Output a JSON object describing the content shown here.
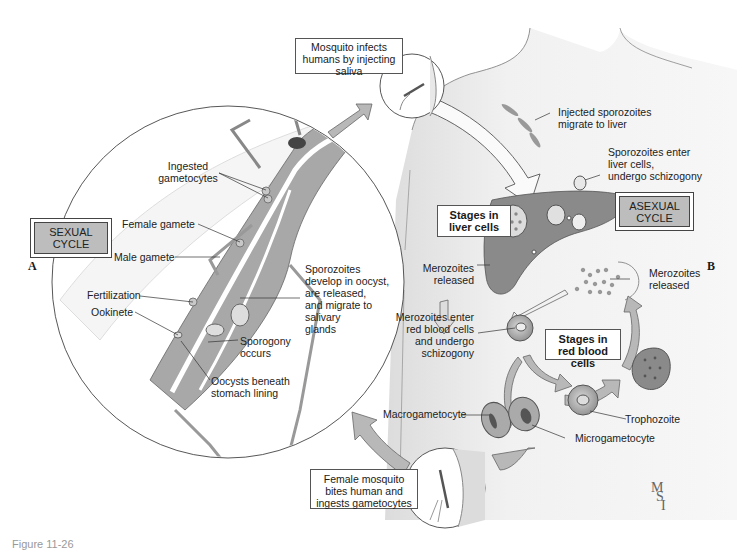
{
  "figure": {
    "caption": "Figure 11-26",
    "signature": [
      "M",
      "S",
      "I"
    ],
    "colors": {
      "cycle_box_fill": "#bdbdbd",
      "arrow_fill": "#b8b8b8",
      "tissue_gray": "#9a9a9a",
      "body_fill": "#ececec",
      "liver_fill": "#8a8a8a"
    }
  },
  "panels": {
    "A": {
      "letter": "A",
      "cycle_box": [
        "SEXUAL",
        "CYCLE"
      ],
      "labels": {
        "ingested_gametocytes": [
          "Ingested",
          "gametocytes"
        ],
        "female_gamete": "Female gamete",
        "male_gamete": "Male gamete",
        "fertilization": "Fertilization",
        "ookinete": "Ookinete",
        "sporozoites_develop": [
          "Sporozoites",
          "develop in oocyst,",
          "are released,",
          "and migrate to",
          "salivary",
          "glands"
        ],
        "sporogony": [
          "Sporogony",
          "occurs"
        ],
        "oocysts": [
          "Oocysts beneath",
          "stomach lining"
        ]
      }
    },
    "B": {
      "letter": "B",
      "cycle_box": [
        "ASEXUAL",
        "CYCLE"
      ],
      "labels": {
        "injected_sporozoites": [
          "Injected sporozoites",
          "migrate to liver"
        ],
        "sporozoites_enter_liver": [
          "Sporozoites enter",
          "liver cells,",
          "undergo schizogony"
        ],
        "stages_liver": [
          "Stages in",
          "liver cells"
        ],
        "merozoites_released_liver": [
          "Merozoites",
          "released"
        ],
        "merozoites_released_rbc": [
          "Merozoites",
          "released"
        ],
        "merozoites_enter_rbc": [
          "Merozoites enter",
          "red blood cells",
          "and undergo",
          "schizogony"
        ],
        "stages_rbc": [
          "Stages in",
          "red blood cells"
        ],
        "trophozoite": "Trophozoite",
        "macrogametocyte": "Macrogametocyte",
        "microgametocyte": "Microgametocyte"
      }
    },
    "transitions": {
      "mosquito_infects": [
        "Mosquito infects",
        "humans by injecting",
        "saliva"
      ],
      "female_mosquito_bites": [
        "Female mosquito",
        "bites human and",
        "ingests gametocytes"
      ]
    }
  }
}
